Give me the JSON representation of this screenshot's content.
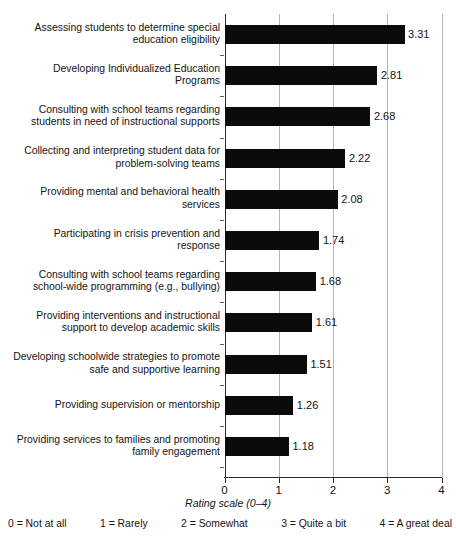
{
  "chart_data": {
    "type": "bar",
    "orientation": "horizontal",
    "title": "",
    "xlabel": "Rating scale (0–4)",
    "ylabel": "",
    "xlim": [
      0,
      4
    ],
    "xticks": [
      "0",
      "1",
      "2",
      "3",
      "4"
    ],
    "grid": true,
    "legend_position": "below-axis",
    "categories": [
      "Assessing students to determine special\neducation eligibility",
      "Developing Individualized Education\nPrograms",
      "Consulting with school teams regarding\nstudents in need of instructional supports",
      "Collecting and interpreting student data for\nproblem-solving teams",
      "Providing mental and behavioral health\nservices",
      "Participating in crisis prevention and\nresponse",
      "Consulting with school teams regarding\nschool-wide programming (e.g., bullying)",
      "Providing interventions and instructional\nsupport to develop academic skills",
      "Developing schoolwide strategies to promote\nsafe and supportive learning",
      "Providing supervision or mentorship",
      "Providing services to families and promoting\nfamily engagement"
    ],
    "values": [
      3.31,
      2.81,
      2.68,
      2.22,
      2.08,
      1.74,
      1.68,
      1.61,
      1.51,
      1.26,
      1.18
    ],
    "value_labels": [
      "3.31",
      "2.81",
      "2.68",
      "2.22",
      "2.08",
      "1.74",
      "1.68",
      "1.61",
      "1.51",
      "1.26",
      "1.18"
    ],
    "bar_color": "#0b0b0b",
    "scale_legend": [
      "0 = Not at all",
      "1 = Rarely",
      "2 = Somewhat",
      "3 = Quite a bit",
      "4 = A great deal"
    ]
  }
}
